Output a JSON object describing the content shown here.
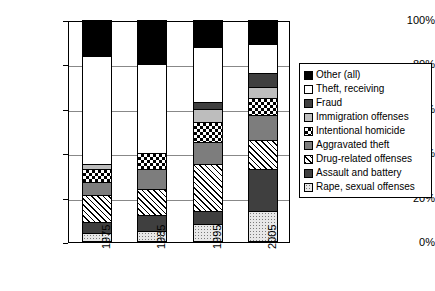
{
  "chart_data": {
    "type": "bar",
    "title": "",
    "subtitle": "",
    "xlabel": "",
    "ylabel": "",
    "stacked": true,
    "normalized_percent": true,
    "grid": true,
    "legend_position": "right",
    "ylim": [
      0,
      100
    ],
    "ytick_labels": [
      "100%",
      "80%",
      "60%",
      "40%",
      "20%",
      "0%"
    ],
    "ytick_values": [
      100,
      80,
      60,
      40,
      20,
      0
    ],
    "categories": [
      "1975",
      "1985",
      "1995",
      "2005"
    ],
    "series": [
      {
        "name": "Rape, sexual offenses",
        "pattern": "dots-light",
        "color": "#e8e8e8",
        "values": [
          4,
          5,
          8,
          14
        ]
      },
      {
        "name": "Assault and battery",
        "pattern": "dark-gray",
        "color": "#3f3f3f",
        "values": [
          5,
          7,
          6,
          19
        ]
      },
      {
        "name": "Drug-related offenses",
        "pattern": "diagonal-hatch",
        "color": "#ffffff",
        "values": [
          12,
          12,
          21,
          13
        ]
      },
      {
        "name": "Aggravated theft",
        "pattern": "mid-gray",
        "color": "#7d7d7d",
        "values": [
          6,
          9,
          10,
          11
        ]
      },
      {
        "name": "Intentional homicide",
        "pattern": "checkerboard",
        "color": "#ffffff",
        "values": [
          6,
          7,
          9,
          8
        ]
      },
      {
        "name": "Immigration offenses",
        "pattern": "light-gray",
        "color": "#bdbdbd",
        "values": [
          2,
          0,
          6,
          5
        ]
      },
      {
        "name": "Fraud",
        "pattern": "dark-gray",
        "color": "#3f3f3f",
        "values": [
          0,
          0,
          3,
          6
        ]
      },
      {
        "name": "Theft, receiving",
        "pattern": "white",
        "color": "#ffffff",
        "values": [
          49,
          40,
          25,
          13
        ]
      },
      {
        "name": "Other (all)",
        "pattern": "solid-black",
        "color": "#000000",
        "values": [
          16,
          20,
          12,
          11
        ]
      }
    ],
    "cumulative_tops": {
      "1975": [
        4,
        9,
        21,
        27,
        33,
        35,
        35,
        84,
        100
      ],
      "1985": [
        5,
        12,
        24,
        33,
        40,
        40,
        40,
        80,
        100
      ],
      "1995": [
        8,
        14,
        35,
        45,
        54,
        60,
        63,
        88,
        100
      ],
      "2005": [
        14,
        33,
        46,
        57,
        65,
        70,
        76,
        89,
        100
      ]
    }
  },
  "legend": {
    "items": [
      {
        "label": "Other (all)",
        "pattern": "solid-black"
      },
      {
        "label": "Theft, receiving",
        "pattern": "white"
      },
      {
        "label": "Fraud",
        "pattern": "dark-gray"
      },
      {
        "label": "Immigration offenses",
        "pattern": "light-gray"
      },
      {
        "label": "Intentional homicide",
        "pattern": "checkerboard"
      },
      {
        "label": "Aggravated theft",
        "pattern": "mid-gray"
      },
      {
        "label": "Drug-related offenses",
        "pattern": "diagonal-hatch"
      },
      {
        "label": "Assault and battery",
        "pattern": "dark-gray"
      },
      {
        "label": "Rape, sexual offenses",
        "pattern": "dots-light"
      }
    ]
  }
}
